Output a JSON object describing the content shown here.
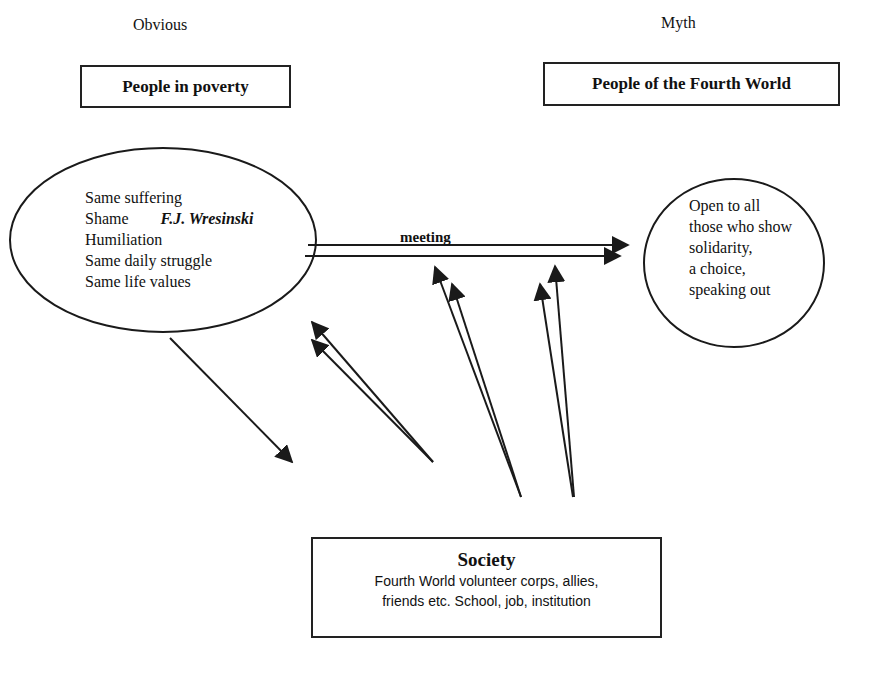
{
  "left_column": {
    "caption": "Obvious",
    "box_title": "People in poverty",
    "ellipse_lines": [
      "Same suffering",
      "Shame",
      "Humiliation",
      "Same daily struggle",
      "Same life values"
    ],
    "attribution": "F.J. Wresinski"
  },
  "right_column": {
    "caption": "Myth",
    "box_title": "People of the Fourth World",
    "ellipse_lines": [
      "Open to all",
      "those who show",
      "solidarity,",
      "a choice,",
      "speaking out"
    ]
  },
  "connector": {
    "label": "meeting"
  },
  "society": {
    "title": "Society",
    "lines": [
      "Fourth World volunteer corps, allies,",
      "friends etc.  School, job, institution"
    ]
  },
  "colors": {
    "stroke": "#1a1a1a",
    "background": "#ffffff"
  }
}
